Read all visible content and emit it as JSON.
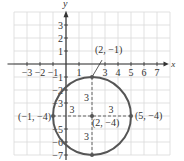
{
  "graph": {
    "origin_px": [
      66,
      64
    ],
    "unit_px": 13,
    "x_range": [
      -4,
      8
    ],
    "y_range": [
      -7,
      4
    ],
    "axis_label_x": "x",
    "axis_label_y": "y",
    "x_ticks": [
      "-3",
      "-2",
      "-1",
      "1",
      "3",
      "4",
      "5",
      "6",
      "7"
    ],
    "y_ticks": [
      "3",
      "2",
      "1",
      "-1",
      "-2",
      "-3",
      "-5",
      "-6",
      "-7"
    ],
    "colors": {
      "grid": "#d9d9d9",
      "axis": "#333333",
      "circle": "#555555",
      "dash": "#555555"
    }
  },
  "circle": {
    "center": [
      2,
      -4
    ],
    "radius": 3
  },
  "points": [
    {
      "label": "(2, −1)",
      "x": 2,
      "y": -1
    },
    {
      "label": "(2, −4)",
      "x": 2,
      "y": -4
    },
    {
      "label": "(5, −4)",
      "x": 5,
      "y": -4
    },
    {
      "label": "(−1, −4)",
      "x": -1,
      "y": -4
    }
  ],
  "radius_labels": [
    "3",
    "3",
    "3",
    "3"
  ]
}
